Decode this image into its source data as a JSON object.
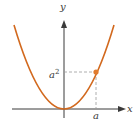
{
  "figure": {
    "labels": {
      "x_axis": "x",
      "y_axis": "y",
      "point_x": "a",
      "point_y_base": "a",
      "point_y_exp": "2"
    },
    "colors": {
      "curve": "#d2691e",
      "point": "#e07b2e",
      "axes": "#3a3a3a",
      "dashed": "#9a9a9a"
    }
  }
}
